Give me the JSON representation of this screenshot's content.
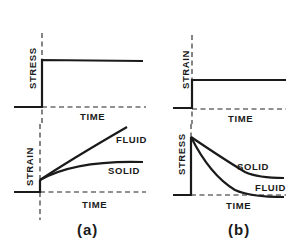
{
  "figure": {
    "panels": [
      {
        "id": "a",
        "caption": "(a)",
        "top_plot": {
          "y_label": "STRESS",
          "x_label": "TIME"
        },
        "bottom_plot": {
          "y_label": "STRAIN",
          "x_label": "TIME",
          "curves": [
            {
              "label": "FLUID"
            },
            {
              "label": "SOLID"
            }
          ]
        }
      },
      {
        "id": "b",
        "caption": "(b)",
        "top_plot": {
          "y_label": "STRAIN",
          "x_label": "TIME"
        },
        "bottom_plot": {
          "y_label": "STRESS",
          "x_label": "TIME",
          "curves": [
            {
              "label": "SOLID"
            },
            {
              "label": "FLUID"
            }
          ]
        }
      }
    ]
  },
  "colors": {
    "ink": "#1a1a1a",
    "background": "#ffffff"
  }
}
